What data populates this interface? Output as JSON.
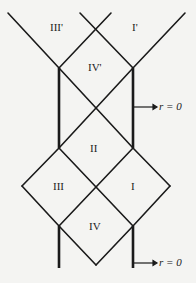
{
  "diagram": {
    "type": "penrose-diagram",
    "regions": [
      {
        "id": "III'",
        "label": "III'"
      },
      {
        "id": "I'",
        "label": "I'"
      },
      {
        "id": "IV'",
        "label": "IV'"
      },
      {
        "id": "II",
        "label": "II"
      },
      {
        "id": "III",
        "label": "III"
      },
      {
        "id": "I",
        "label": "I"
      },
      {
        "id": "IV",
        "label": "IV"
      }
    ],
    "annotations": [
      {
        "id": "singularity-upper",
        "text": "r = 0"
      },
      {
        "id": "singularity-lower",
        "text": "r = 0"
      }
    ],
    "colors": {
      "line": "#1a1a1a",
      "background": "#f4f4f2"
    }
  }
}
